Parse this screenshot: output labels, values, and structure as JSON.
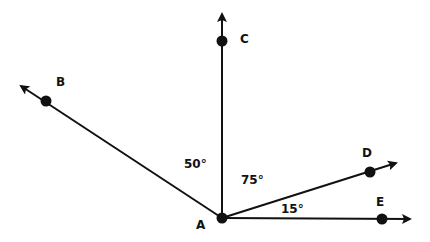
{
  "diagram": {
    "colors": {
      "stroke": "#111111",
      "background": "#ffffff"
    },
    "vertex": {
      "label": "A",
      "x": 222,
      "y": 218
    },
    "rays": [
      {
        "id": "C",
        "label": "C",
        "dot": [
          222,
          41
        ],
        "tip": [
          222,
          14
        ],
        "label_pos": [
          240,
          43
        ]
      },
      {
        "id": "B",
        "label": "B",
        "dot": [
          46,
          101
        ],
        "tip": [
          21,
          86
        ],
        "label_pos": [
          56,
          86
        ]
      },
      {
        "id": "D",
        "label": "D",
        "dot": [
          370,
          172
        ],
        "tip": [
          396,
          163
        ],
        "label_pos": [
          362,
          157
        ]
      },
      {
        "id": "E",
        "label": "E",
        "dot": [
          382,
          219
        ],
        "tip": [
          410,
          219
        ],
        "label_pos": [
          376,
          206
        ]
      }
    ],
    "angles": [
      {
        "label": "50°",
        "between": [
          "B",
          "C"
        ],
        "pos": [
          184,
          168
        ]
      },
      {
        "label": "75°",
        "between": [
          "C",
          "D"
        ],
        "pos": [
          241,
          184
        ]
      },
      {
        "label": "15°",
        "between": [
          "D",
          "E"
        ],
        "pos": [
          281,
          213
        ]
      }
    ]
  }
}
